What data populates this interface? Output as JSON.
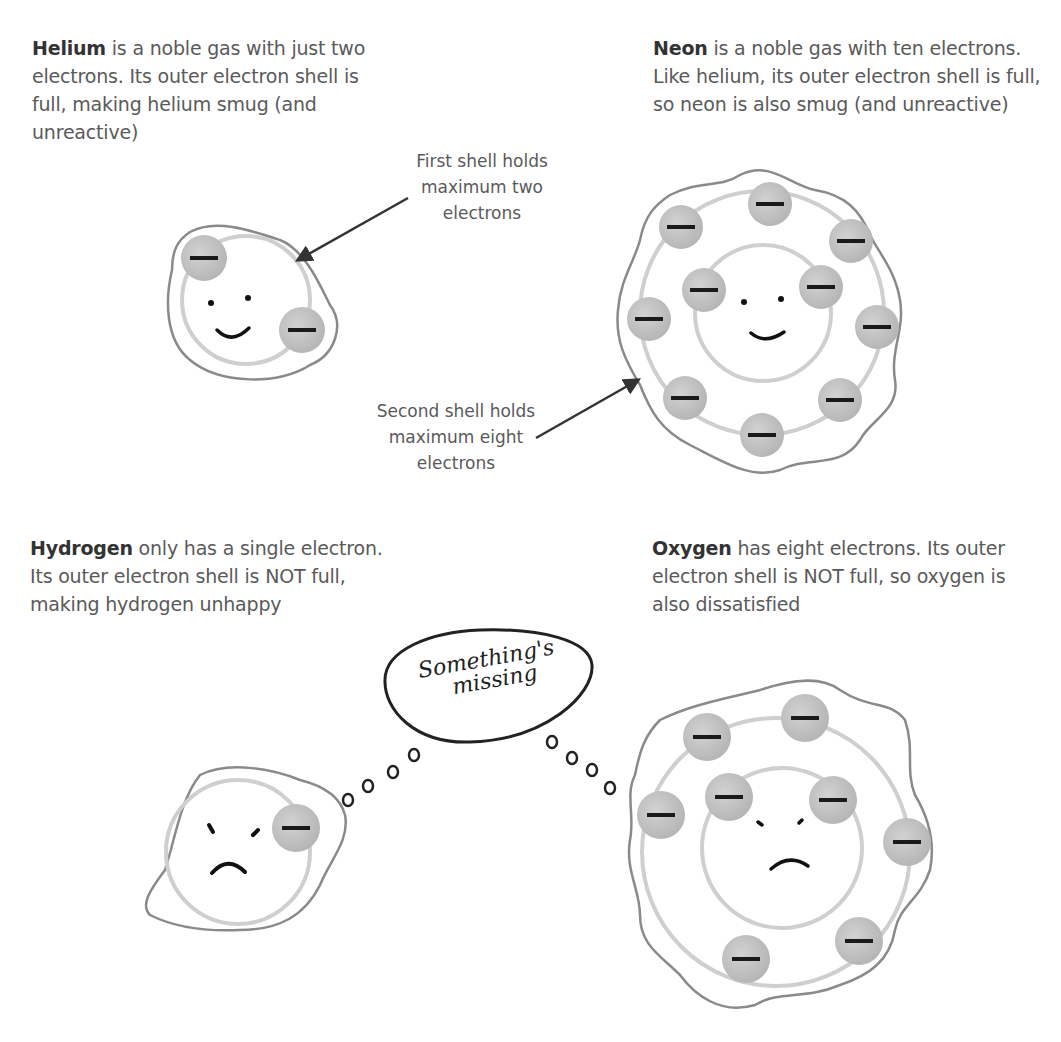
{
  "captions": {
    "helium": {
      "name": "Helium",
      "text": " is a noble gas with just two electrons. Its outer electron shell is full, making helium smug (and unreactive)"
    },
    "neon": {
      "name": "Neon",
      "text": " is a noble gas with ten electrons. Like helium, its outer electron shell is full, so neon is also smug (and unreactive)"
    },
    "hydrogen": {
      "name": "Hydrogen",
      "text": " only has a single electron. Its outer electron shell is NOT full, making hydrogen unhappy"
    },
    "oxygen": {
      "name": "Oxygen",
      "text": " has eight electrons. Its outer electron shell is NOT full, so oxygen is also dissatisfied"
    }
  },
  "annotations": {
    "first_shell": "First shell holds maximum two electrons",
    "second_shell": "Second shell holds maximum eight electrons"
  },
  "thought_bubble": {
    "line1": "Something's",
    "line2": "missing"
  },
  "atoms": {
    "helium": {
      "electrons": 2,
      "shells": [
        2
      ],
      "mood": "smug"
    },
    "neon": {
      "electrons": 10,
      "shells": [
        2,
        8
      ],
      "mood": "smug"
    },
    "hydrogen": {
      "electrons": 1,
      "shells": [
        1
      ],
      "mood": "unhappy"
    },
    "oxygen": {
      "electrons": 8,
      "shells": [
        2,
        6
      ],
      "mood": "dissatisfied"
    }
  },
  "electron_symbol": "−",
  "colors": {
    "electron_fill": "#c4c4c4",
    "shell_line": "#cfcfcf",
    "outline": "#8a8a8a",
    "text": "#5a5a5a"
  }
}
